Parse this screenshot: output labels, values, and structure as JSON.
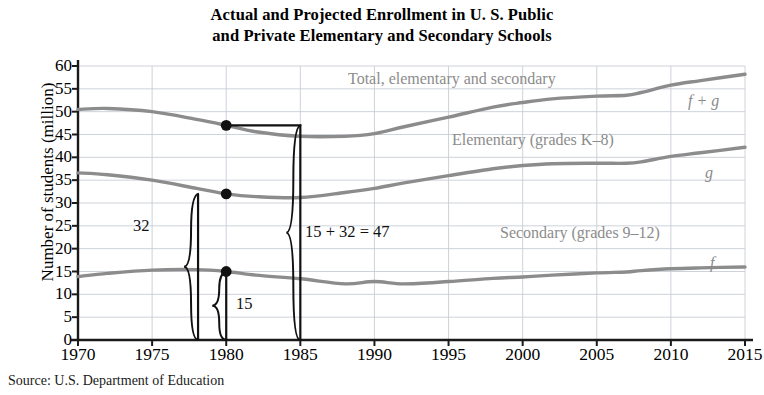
{
  "title": {
    "line1": "Actual and Projected Enrollment in U. S. Public",
    "line2": "and Private Elementary and Secondary Schools"
  },
  "source": "Source: U.S. Department of Education",
  "axes": {
    "ylabel": "Number of students (million)",
    "xlabel": "",
    "yticks": [
      0,
      5,
      10,
      15,
      20,
      25,
      30,
      35,
      40,
      45,
      50,
      55,
      60
    ],
    "xticks": [
      1970,
      1975,
      1980,
      1985,
      1990,
      1995,
      2000,
      2005,
      2010,
      2015
    ],
    "ylim": [
      0,
      60
    ],
    "xlim": [
      1970,
      2015
    ],
    "grid": true,
    "grid_color": "#c8cdd6",
    "frame_color": "#1a1a1a"
  },
  "series_labels": {
    "total": "Total, elementary and secondary",
    "total_fn": "f + g",
    "elementary": "Elementary (grades K–8)",
    "elementary_fn": "g",
    "secondary": "Secondary (grades 9–12)",
    "secondary_fn": "f"
  },
  "annotations": {
    "bracket_32": "32",
    "bracket_15": "15",
    "bracket_sum": "15 + 32 = 47",
    "marker_year": 1980,
    "marker_total": 47,
    "marker_elementary": 32,
    "marker_secondary": 15
  },
  "colors": {
    "curve": "#8c8c8c",
    "annotation": "#111111",
    "label_text": "#8c8c8c",
    "background": "#ffffff"
  },
  "chart_data": {
    "type": "line",
    "title": "Actual and Projected Enrollment in U. S. Public and Private Elementary and Secondary Schools",
    "xlabel": "",
    "ylabel": "Number of students (million)",
    "xlim": [
      1970,
      2015
    ],
    "ylim": [
      0,
      60
    ],
    "grid": true,
    "legend": "inline-labels",
    "x": [
      1970,
      1972,
      1975,
      1978,
      1980,
      1982,
      1985,
      1988,
      1990,
      1992,
      1995,
      1998,
      2000,
      2002,
      2005,
      2007,
      2008,
      2010,
      2012,
      2015
    ],
    "series": [
      {
        "name": "Total, elementary and secondary",
        "fn": "f + g",
        "values": [
          50.5,
          50.7,
          50.0,
          48.3,
          47.0,
          45.6,
          44.6,
          44.6,
          45.2,
          46.7,
          48.8,
          51.0,
          52.0,
          52.8,
          53.4,
          53.6,
          54.2,
          55.8,
          56.8,
          58.2
        ]
      },
      {
        "name": "Elementary (grades K–8)",
        "fn": "g",
        "values": [
          36.6,
          36.2,
          35.0,
          33.2,
          32.0,
          31.4,
          31.2,
          32.3,
          33.2,
          34.4,
          36.0,
          37.5,
          38.2,
          38.6,
          38.7,
          38.7,
          39.0,
          40.2,
          41.0,
          42.2
        ]
      },
      {
        "name": "Secondary (grades 9–12)",
        "fn": "f",
        "values": [
          13.9,
          14.6,
          15.3,
          15.4,
          15.0,
          14.2,
          13.4,
          12.3,
          12.8,
          12.3,
          12.8,
          13.5,
          13.8,
          14.2,
          14.7,
          14.9,
          15.2,
          15.6,
          15.8,
          16.0
        ]
      }
    ],
    "markers": [
      {
        "x": 1980,
        "y": 47,
        "series": "f + g"
      },
      {
        "x": 1980,
        "y": 32,
        "series": "g"
      },
      {
        "x": 1980,
        "y": 15,
        "series": "f"
      }
    ],
    "annotations": [
      {
        "text": "32",
        "meaning": "elementary value at 1980"
      },
      {
        "text": "15",
        "meaning": "secondary value at 1980"
      },
      {
        "text": "15 + 32 = 47",
        "meaning": "total value at 1980"
      }
    ],
    "source": "Source: U.S. Department of Education"
  }
}
